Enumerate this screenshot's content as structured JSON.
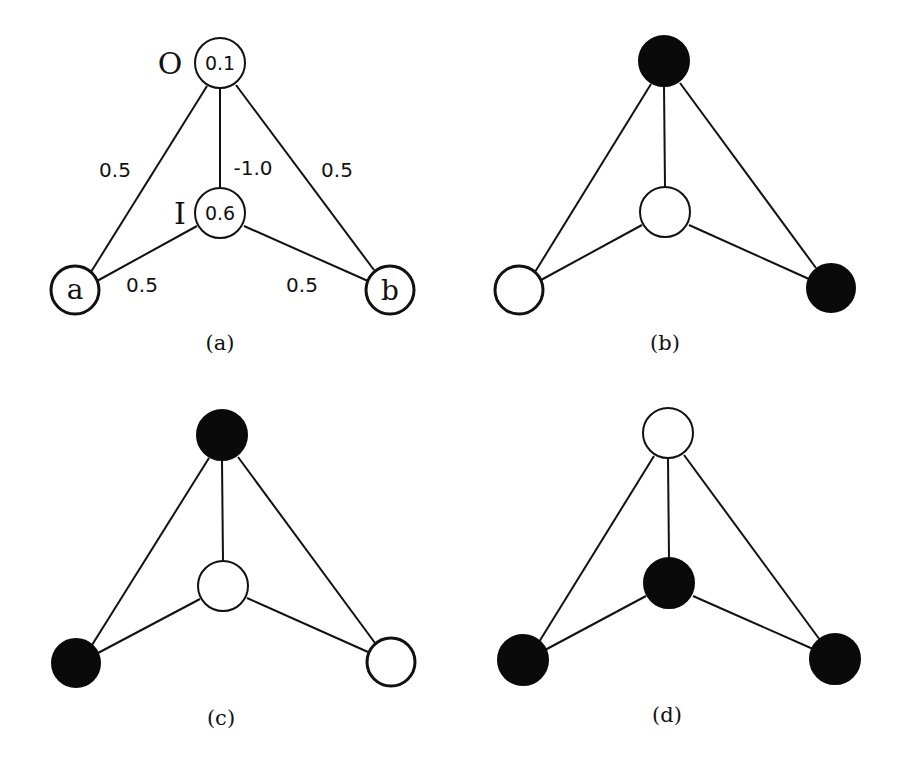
{
  "figure": {
    "panels": [
      {
        "id": "a",
        "caption": "(a)",
        "nodes": {
          "O": {
            "label": "O",
            "value": "0.1",
            "state": "unlabeled"
          },
          "I": {
            "label": "I",
            "value": "0.6",
            "state": "unlabeled"
          },
          "a": {
            "label": "a",
            "state": "input"
          },
          "b": {
            "label": "b",
            "state": "input"
          }
        },
        "weights": {
          "a_O": "0.5",
          "I_O": "-1.0",
          "b_O": "0.5",
          "a_I": "0.5",
          "b_I": "0.5"
        }
      },
      {
        "id": "b",
        "caption": "(b)",
        "nodes": {
          "O": {
            "state": "on"
          },
          "I": {
            "state": "off"
          },
          "a": {
            "state": "off"
          },
          "b": {
            "state": "on"
          }
        }
      },
      {
        "id": "c",
        "caption": "(c)",
        "nodes": {
          "O": {
            "state": "on"
          },
          "I": {
            "state": "off"
          },
          "a": {
            "state": "on"
          },
          "b": {
            "state": "off"
          }
        }
      },
      {
        "id": "d",
        "caption": "(d)",
        "nodes": {
          "O": {
            "state": "off"
          },
          "I": {
            "state": "on"
          },
          "a": {
            "state": "on"
          },
          "b": {
            "state": "on"
          }
        }
      }
    ],
    "legend": {
      "filled": "on (black)",
      "hollow": "off (white)"
    },
    "colors": {
      "ink": "#111111",
      "background": "#ffffff"
    }
  }
}
